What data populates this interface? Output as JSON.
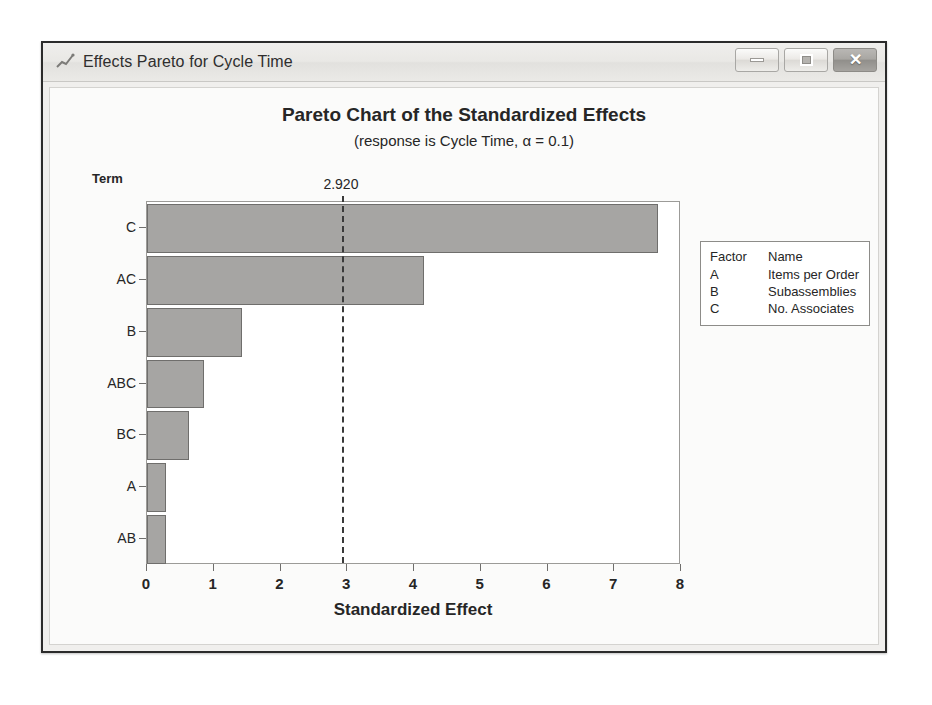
{
  "window": {
    "title": "Effects Pareto for Cycle Time",
    "icon": "line-chart-icon",
    "buttons": {
      "minimize": "minimize-icon",
      "maximize": "maximize-icon",
      "close": "✕"
    }
  },
  "chart_data": {
    "type": "bar",
    "orientation": "horizontal",
    "title": "Pareto Chart of the Standardized Effects",
    "subtitle": "(response is Cycle Time, α = 0.1)",
    "xlabel": "Standardized Effect",
    "ylabel": "Term",
    "categories": [
      "C",
      "AC",
      "B",
      "ABC",
      "BC",
      "A",
      "AB"
    ],
    "values": [
      7.66,
      4.15,
      1.43,
      0.85,
      0.63,
      0.29,
      0.28
    ],
    "xlim": [
      0,
      8
    ],
    "xticks": [
      "0",
      "1",
      "2",
      "3",
      "4",
      "5",
      "6",
      "7",
      "8"
    ],
    "grid": false,
    "reference_line": {
      "value": 2.92,
      "label": "2.920",
      "style": "dashed"
    },
    "bar_color": "#a6a5a3",
    "bar_border_color": "#6f6e6c",
    "legend_position": "right",
    "legend": {
      "headers": [
        "Factor",
        "Name"
      ],
      "rows": [
        {
          "factor": "A",
          "name": "Items per Order"
        },
        {
          "factor": "B",
          "name": "Subassemblies"
        },
        {
          "factor": "C",
          "name": "No. Associates"
        }
      ]
    }
  }
}
